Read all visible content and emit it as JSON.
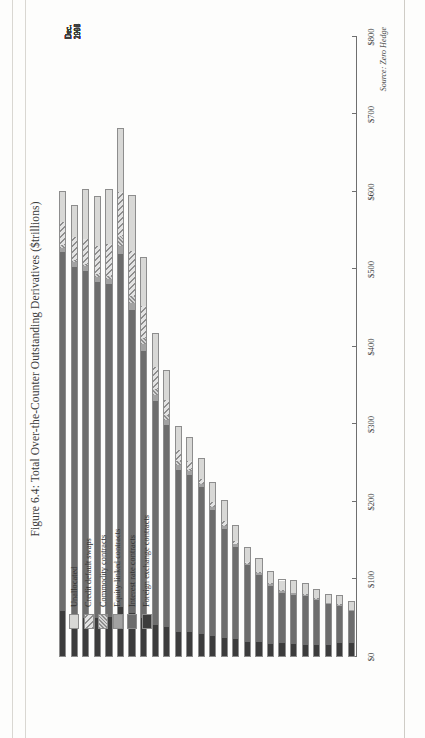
{
  "figure": {
    "title": "Figure 6.4: Total Over-the-Counter Outstanding Derivatives ($trillions)",
    "source": "Source: Zero Hedge"
  },
  "legend": {
    "items": [
      {
        "label": "Unallocated",
        "key": "unallocated",
        "swatch": "light-gray-solid"
      },
      {
        "label": "Credit default swaps",
        "key": "cds",
        "swatch": "wide-diagonal-hatch"
      },
      {
        "label": "Commodity contracts",
        "key": "commodity",
        "swatch": "dense-diagonal-hatch"
      },
      {
        "label": "Equity-linked contracts",
        "key": "equity",
        "swatch": "medium-gray-solid"
      },
      {
        "label": "Interest rate contracts",
        "key": "interest_rate",
        "swatch": "dark-gray-solid"
      },
      {
        "label": "Foreign exchange contracts",
        "key": "foreign_exchange",
        "swatch": "darkest-gray-solid"
      }
    ]
  },
  "axis": {
    "value_ticks": [
      "$0",
      "$100",
      "$200",
      "$300",
      "$400",
      "$500",
      "$600",
      "$700",
      "$800"
    ],
    "value_min": 0,
    "value_max": 800,
    "value_unit": "$trillions"
  },
  "chart_data": {
    "type": "bar",
    "orientation": "horizontal-stacked",
    "title": "Figure 6.4: Total Over-the-Counter Outstanding Derivatives ($trillions)",
    "xlabel": "",
    "ylabel": "$trillions",
    "xlim": [
      0,
      800
    ],
    "grid": false,
    "legend_position": "bottom-left",
    "annotations": [
      "Source: Zero Hedge"
    ],
    "categories": [
      "Jun. 1998",
      "Dec. 1998",
      "Jun. 1999",
      "Dec. 1999",
      "Jun. 2000",
      "Dec. 2000",
      "Jun. 2001",
      "Dec. 2001",
      "Jun. 2002",
      "Dec. 2002",
      "Jun. 2003",
      "Dec. 2003",
      "Jun. 2004",
      "Dec. 2004",
      "Jun. 2005",
      "Dec. 2005",
      "Jun. 2006",
      "Dec. 2006",
      "Jun. 2007",
      "Dec. 2007",
      "Jun. 2008",
      "Dec. 2008",
      "Jun. 2009",
      "Dec. 2009",
      "Jun. 2010",
      "Dec. 2010"
    ],
    "tick_labels": [
      "Jun.\n1998",
      "Dec.\n1998",
      "",
      "Dec.\n1999",
      "",
      "Dec.\n2000",
      "",
      "Dec.\n2001",
      "",
      "Dec.\n2002",
      "",
      "Dec.\n2003",
      "",
      "Dec.\n2004",
      "",
      "Dec.\n2005",
      "",
      "Dec.\n2006",
      "",
      "Dec.\n2007",
      "",
      "Dec.\n2008",
      "",
      "Dec.\n2009",
      "",
      "Dec.\n2010"
    ],
    "series": [
      {
        "name": "Foreign exchange contracts",
        "key": "foreign_exchange",
        "values": [
          18,
          18,
          15,
          14,
          15,
          16,
          17,
          16,
          18,
          18,
          22,
          24,
          26,
          29,
          31,
          31,
          38,
          40,
          49,
          56,
          63,
          50,
          49,
          49,
          53,
          58
        ]
      },
      {
        "name": "Interest rate contracts",
        "key": "interest_rate",
        "values": [
          42,
          50,
          54,
          60,
          64,
          65,
          67,
          77,
          90,
          102,
          122,
          142,
          165,
          191,
          205,
          212,
          262,
          292,
          347,
          393,
          458,
          432,
          437,
          450,
          452,
          465
        ]
      },
      {
        "name": "Equity-linked contracts",
        "key": "equity",
        "values": [
          1,
          1,
          1,
          2,
          2,
          2,
          2,
          2,
          2,
          2,
          3,
          4,
          4,
          4,
          5,
          6,
          7,
          8,
          9,
          9,
          10,
          6,
          6,
          6,
          6,
          6
        ]
      },
      {
        "name": "Commodity contracts",
        "key": "commodity",
        "values": [
          0,
          1,
          1,
          1,
          1,
          1,
          1,
          1,
          1,
          1,
          1,
          1,
          1,
          1,
          3,
          6,
          6,
          7,
          8,
          9,
          13,
          4,
          4,
          3,
          3,
          3
        ]
      },
      {
        "name": "Credit default swaps",
        "key": "cds",
        "values": [
          0,
          0,
          0,
          0,
          0,
          0,
          0,
          0,
          0,
          2,
          3,
          6,
          6,
          6,
          10,
          14,
          20,
          29,
          42,
          58,
          57,
          42,
          36,
          33,
          30,
          30
        ]
      },
      {
        "name": "Unallocated",
        "key": "unallocated",
        "values": [
          11,
          11,
          10,
          11,
          13,
          15,
          13,
          15,
          18,
          18,
          20,
          25,
          25,
          26,
          30,
          30,
          37,
          43,
          62,
          71,
          82,
          70,
          64,
          63,
          40,
          39
        ]
      }
    ],
    "totals": [
      72,
      80,
      81,
      88,
      95,
      99,
      100,
      111,
      128,
      142,
      170,
      202,
      226,
      257,
      284,
      298,
      370,
      418,
      516,
      596,
      683,
      604,
      595,
      604,
      583,
      601
    ]
  }
}
